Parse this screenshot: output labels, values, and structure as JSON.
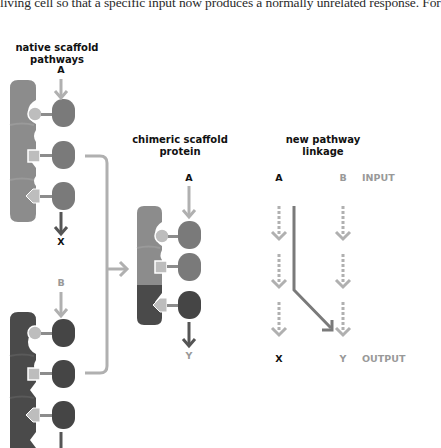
{
  "caption": {
    "text": "living cell so that a specific input now produces a normally unrelated response. For"
  },
  "panels": {
    "native": {
      "title_line1": "native scaffold",
      "title_line2": "pathways",
      "pathway_1": {
        "input": "A",
        "output": "X"
      },
      "pathway_2": {
        "input": "B",
        "output": "Y"
      }
    },
    "chimeric": {
      "title_line1": "chimeric scaffold",
      "title_line2": "protein",
      "input": "A",
      "output": "Y"
    },
    "linkage": {
      "title_line1": "new pathway",
      "title_line2": "linkage",
      "inputs": [
        "A",
        "B"
      ],
      "outputs": [
        "X",
        "Y"
      ],
      "input_label": "INPUT",
      "output_label": "OUTPUT"
    }
  },
  "colors": {
    "scaffold_a": "#8c8c8c",
    "scaffold_b": "#4a4a4a",
    "enzyme_a": "#7a7a7a",
    "enzyme_b": "#454545",
    "arrow_light": "#b0b0b0",
    "arrow_dark": "#6e6e6e",
    "linker": "#a8a8a8"
  }
}
